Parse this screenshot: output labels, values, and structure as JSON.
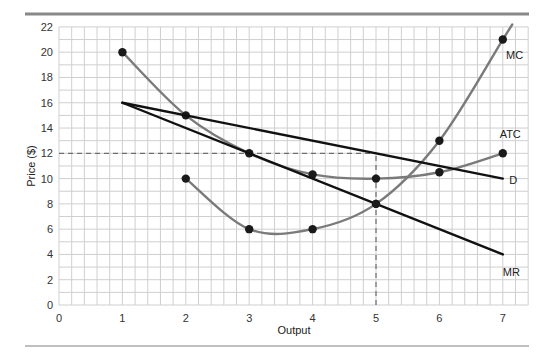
{
  "chart_data": {
    "type": "line",
    "title": "",
    "xlabel": "Output",
    "ylabel": "Price ($)",
    "xlim": [
      0,
      7.4
    ],
    "ylim": [
      0,
      22
    ],
    "x_ticks": [
      0,
      1,
      2,
      3,
      4,
      5,
      6,
      7
    ],
    "y_ticks": [
      0,
      2,
      4,
      6,
      8,
      10,
      12,
      14,
      16,
      18,
      20,
      22
    ],
    "grid": true,
    "legend": "none (curves labeled inline)",
    "series": [
      {
        "name": "MC",
        "color": "#7a7a7a",
        "points": [
          [
            2,
            10
          ],
          [
            3,
            6
          ],
          [
            4,
            6
          ],
          [
            5,
            8
          ],
          [
            6,
            13
          ],
          [
            7,
            21
          ]
        ],
        "label_at": [
          7.05,
          19.5
        ],
        "smooth": true
      },
      {
        "name": "ATC",
        "color": "#7a7a7a",
        "points": [
          [
            1,
            20
          ],
          [
            2,
            15
          ],
          [
            3,
            12
          ],
          [
            4,
            10.33
          ],
          [
            5,
            10
          ],
          [
            6,
            10.5
          ],
          [
            7,
            12
          ]
        ],
        "label_at": [
          6.95,
          13.2
        ],
        "smooth": true
      },
      {
        "name": "D",
        "color": "#111111",
        "points": [
          [
            1,
            16
          ],
          [
            7,
            10
          ]
        ],
        "label_at": [
          7.1,
          9.6
        ],
        "smooth": false
      },
      {
        "name": "MR",
        "color": "#111111",
        "points": [
          [
            1,
            16
          ],
          [
            7,
            4
          ]
        ],
        "label_at": [
          7.0,
          2.3
        ],
        "smooth": false
      }
    ],
    "annotations": [
      {
        "type": "dashed-hline",
        "y": 12,
        "x_from": 0,
        "x_to": 5,
        "meaning": "profit-maximizing price"
      },
      {
        "type": "dashed-vline",
        "x": 5,
        "y_from": 0,
        "y_to": 12,
        "meaning": "profit-maximizing output"
      }
    ]
  }
}
